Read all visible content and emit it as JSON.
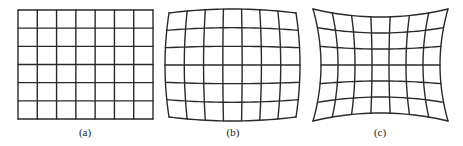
{
  "figure": {
    "grid": {
      "columns": 7,
      "rows": 6
    },
    "line_color": "#2a2a2a",
    "panels": [
      {
        "id": "a",
        "label": "(a)",
        "distortion": "none",
        "corners": {
          "tl": [
            18,
            10
          ],
          "tr": [
            153,
            10
          ],
          "bl": [
            18,
            119
          ],
          "br": [
            153,
            119
          ]
        },
        "bulge": 0,
        "label_x": 85
      },
      {
        "id": "b",
        "label": "(b)",
        "distortion": "barrel",
        "corners": {
          "tl": [
            169,
            13
          ],
          "tr": [
            296,
            13
          ],
          "bl": [
            169,
            117
          ],
          "br": [
            296,
            117
          ]
        },
        "bulge": 4,
        "label_x": 233
      },
      {
        "id": "c",
        "label": "(c)",
        "distortion": "pincushion",
        "corners": {
          "tl": [
            313,
            9
          ],
          "tr": [
            448,
            9
          ],
          "bl": [
            313,
            121
          ],
          "br": [
            448,
            121
          ]
        },
        "bulge": -8,
        "label_x": 380
      }
    ]
  }
}
